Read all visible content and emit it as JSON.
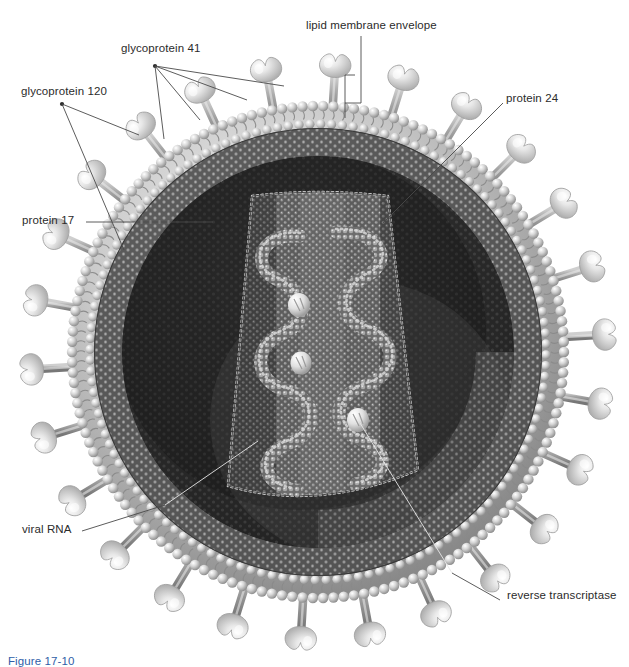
{
  "figure": {
    "caption": "Figure 17-10",
    "background_color": "#ffffff",
    "text_color": "#2b2b2b",
    "caption_color": "#2f5ea8",
    "leader_line_color": "#4a4a4a",
    "inner_leader_line_color": "#e8e8e8"
  },
  "labels": [
    {
      "id": "gp41",
      "text": "glycoprotein 41",
      "x": 121,
      "y": 49,
      "anchor": "start"
    },
    {
      "id": "gp120",
      "text": "glycoprotein 120",
      "x": 21,
      "y": 92,
      "anchor": "start"
    },
    {
      "id": "lipid",
      "text": "lipid membrane envelope",
      "x": 306,
      "y": 26,
      "anchor": "start"
    },
    {
      "id": "p24",
      "text": "protein 24",
      "x": 506,
      "y": 99,
      "anchor": "start"
    },
    {
      "id": "p17",
      "text": "protein 17",
      "x": 22,
      "y": 221,
      "anchor": "start"
    },
    {
      "id": "rna",
      "text": "viral RNA",
      "x": 22,
      "y": 530,
      "anchor": "start"
    },
    {
      "id": "rt",
      "text": "reverse transcriptase",
      "x": 507,
      "y": 596,
      "anchor": "start"
    }
  ],
  "structures": {
    "envelope": {
      "name": "lipid membrane envelope",
      "center": [
        318,
        352
      ],
      "outer_membrane_radius": 246,
      "inner_membrane_radius": 228,
      "color_light": "#dcdcdc",
      "color_dark": "#6f6f6f"
    },
    "matrix": {
      "name": "protein 17 matrix layer",
      "outer_radius": 224,
      "inner_radius": 196,
      "mesh": "hexagonal"
    },
    "capsid": {
      "name": "protein 24 capsid",
      "shape": "truncated cone",
      "top_half_width": 70,
      "bottom_half_width": 98,
      "top_y": 196,
      "bottom_y": 500
    },
    "spikes": {
      "name": "glycoprotein spikes",
      "count": 26,
      "head": "glycoprotein 120",
      "stalk": "glycoprotein 41",
      "head_color": "#e4e4e4",
      "stalk_color": "#9a9a9a"
    },
    "rna": {
      "name": "viral RNA",
      "strands": 2,
      "form": "coiled beaded helix"
    },
    "reverse_transcriptase": {
      "name": "reverse transcriptase",
      "count": 3,
      "positions": [
        [
          299,
          305
        ],
        [
          301,
          363
        ],
        [
          358,
          420
        ]
      ],
      "color": "#f2f2f2"
    }
  }
}
